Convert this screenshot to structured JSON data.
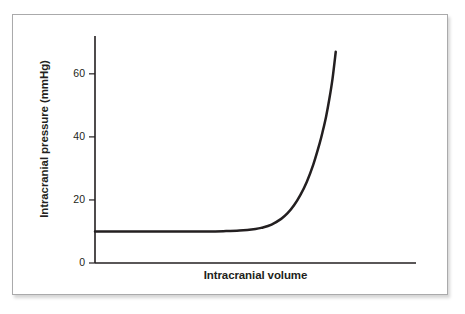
{
  "figure": {
    "background_color": "#ffffff",
    "border_color": "#aaaaab",
    "axis_color": "#231f20",
    "curve_color": "#231f20"
  },
  "chart_data": {
    "type": "line",
    "title": "",
    "subtitle": "",
    "xlabel": "Intracranial volume",
    "ylabel": "Intracranial pressure (mmHg)",
    "xlim": [
      0,
      100
    ],
    "ylim": [
      0,
      72
    ],
    "grid": false,
    "legend": false,
    "legend_position": "none",
    "x_tick_labels": [],
    "y_ticks": [
      0,
      20,
      40,
      60
    ],
    "y_tick_labels": [
      "0",
      "20",
      "40",
      "60"
    ],
    "annotations": [],
    "series": [
      {
        "name": "Intracranial pressure-volume curve",
        "x": [
          0,
          5,
          10,
          15,
          20,
          25,
          30,
          35,
          40,
          45,
          50,
          52,
          55,
          58,
          60,
          62,
          64,
          66,
          68,
          70,
          71,
          72,
          73,
          74,
          75
        ],
        "values": [
          10,
          10,
          10,
          10,
          10,
          10,
          10,
          10,
          10.1,
          10.3,
          10.8,
          11.2,
          12.2,
          14.0,
          15.8,
          18.3,
          21.6,
          25.8,
          31.2,
          38.0,
          42.0,
          46.5,
          52.0,
          58.5,
          67.0
        ]
      }
    ]
  },
  "axis_labels": {
    "y_title": "Intracranial pressure (mmHg)",
    "x_title": "Intracranial volume"
  },
  "y_tick_text": {
    "t0": "0",
    "t20": "20",
    "t40": "40",
    "t60": "60"
  }
}
